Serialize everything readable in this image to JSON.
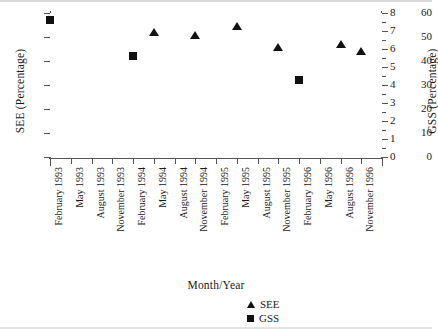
{
  "chart_data": {
    "type": "scatter",
    "title": "",
    "xlabel": "Month/Year",
    "ylabel": "SEE (Percentage)",
    "y2label": "GSS (Percentage)",
    "grid": false,
    "legend_position": "bottom-right",
    "categories": [
      "February 1993",
      "May 1993",
      "August 1993",
      "November 1993",
      "February 1994",
      "May 1994",
      "August 1994",
      "November 1994",
      "February 1995",
      "May 1995",
      "August 1995",
      "November 1995",
      "February 1996",
      "May 1996",
      "August 1996",
      "November 1996"
    ],
    "ylim": [
      0,
      60
    ],
    "yticks": [
      0,
      10,
      20,
      30,
      40,
      50,
      60
    ],
    "y2lim": [
      0,
      8
    ],
    "y2ticks": [
      0,
      1,
      2,
      3,
      4,
      5,
      6,
      7,
      8
    ],
    "series": [
      {
        "name": "SEE",
        "marker": "triangle",
        "axis": "left",
        "color": "#111111",
        "points": [
          {
            "x": "May 1994",
            "y": 52.0
          },
          {
            "x": "November 1994",
            "y": 51.0
          },
          {
            "x": "May 1995",
            "y": 54.5
          },
          {
            "x": "November 1995",
            "y": 46.0
          },
          {
            "x": "August 1996",
            "y": 47.0
          },
          {
            "x": "November 1996",
            "y": 44.0
          }
        ]
      },
      {
        "name": "GSS",
        "marker": "square",
        "axis": "right",
        "color": "#111111",
        "points": [
          {
            "x": "February 1993",
            "y": 7.6
          },
          {
            "x": "February 1994",
            "y": 5.6
          },
          {
            "x": "February 1996",
            "y": 4.3
          }
        ]
      }
    ],
    "legend": [
      {
        "label": "SEE",
        "marker": "triangle"
      },
      {
        "label": "GSS",
        "marker": "square"
      }
    ]
  },
  "axes": {
    "left": {
      "title": "SEE (Percentage)",
      "ticklabels": [
        "60",
        "50",
        "40",
        "30",
        "20",
        "10",
        "0"
      ]
    },
    "right": {
      "title": "GSS (Percentage)",
      "ticklabels": [
        "8",
        "7",
        "6",
        "5",
        "4",
        "3",
        "2",
        "1",
        "0"
      ]
    },
    "bottom": {
      "title": "Month/Year",
      "ticklabels": [
        "February 1993",
        "May 1993",
        "August 1993",
        "November 1993",
        "February 1994",
        "May 1994",
        "August 1994",
        "November 1994",
        "February 1995",
        "May 1995",
        "August 1995",
        "November 1995",
        "February 1996",
        "May 1996",
        "August 1996",
        "November 1996"
      ]
    }
  },
  "legend": {
    "see_label": "SEE",
    "gss_label": "GSS"
  }
}
